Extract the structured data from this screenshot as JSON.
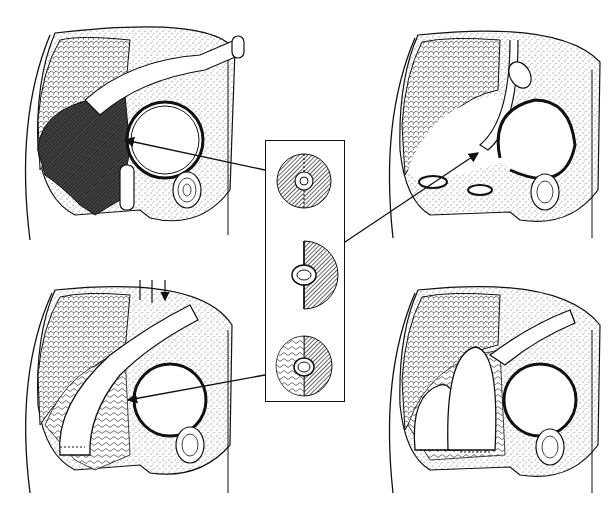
{
  "figure": {
    "colors": {
      "ink": "#111111",
      "background": "#ffffff",
      "hatch": "#333333",
      "stipple": "#555555"
    },
    "panels": [
      {
        "id": "top-left",
        "content": "pelvis section with dark hatched cavity, colon segment and bladder; arrow pointing to anastomosis site"
      },
      {
        "id": "top-right",
        "content": "pelvis section with open ring stomas and divided bowel; arrow from inset to proximal limb"
      },
      {
        "id": "bottom-left",
        "content": "pelvis section with mobilized colon, small downward arrows at top, arrow pointing to anastomosis"
      },
      {
        "id": "bottom-right",
        "content": "pelvis section with reconstructed colon loops and sutured anastomosis"
      }
    ],
    "inset": {
      "details": [
        {
          "id": "detail-1",
          "content": "hatched disc with central ring and vertical dotted line"
        },
        {
          "id": "detail-2",
          "content": "half hatched disc with oval ring on straight edge"
        },
        {
          "id": "detail-3",
          "content": "disc half hatched, half textured tissue, with oval ring"
        }
      ]
    },
    "arrows": [
      {
        "from": "inset-detail-1",
        "to": "top-left"
      },
      {
        "from": "inset-detail-2",
        "to": "top-right"
      },
      {
        "from": "inset-detail-3",
        "to": "bottom-left"
      }
    ]
  }
}
